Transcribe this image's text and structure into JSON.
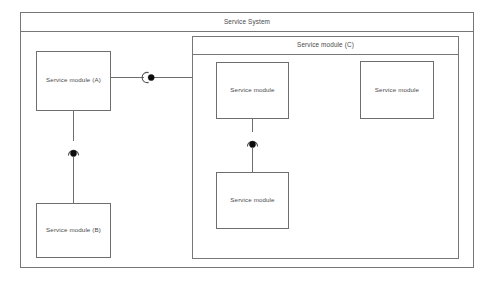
{
  "diagram": {
    "type": "uml-component-diagram",
    "background_color": "#ffffff",
    "border_color": "#777777",
    "text_color": "#4a4a4a",
    "connector_ball_color": "#0d0d0d",
    "system": {
      "title": "Service System",
      "title_position": "top-center"
    },
    "container": {
      "title": "Service module (C)",
      "title_position": "top-center"
    },
    "modules": {
      "a": {
        "label": "Service module (A)"
      },
      "b": {
        "label": "Service module (B)"
      },
      "c_top_left": {
        "label": "Service module"
      },
      "c_top_right": {
        "label": "Service module"
      },
      "c_bottom": {
        "label": "Service module"
      }
    },
    "connectors": [
      {
        "name": "connector-a-to-c",
        "from": "Service module (A)",
        "to": "Service module (C)",
        "orientation": "horizontal",
        "style": "ball-and-socket"
      },
      {
        "name": "connector-a-to-b",
        "from": "Service module (A)",
        "to": "Service module (B)",
        "orientation": "vertical",
        "style": "ball-and-socket"
      },
      {
        "name": "connector-c-inner",
        "from": "Service module",
        "to": "Service module",
        "orientation": "vertical",
        "style": "ball-and-socket"
      }
    ]
  }
}
